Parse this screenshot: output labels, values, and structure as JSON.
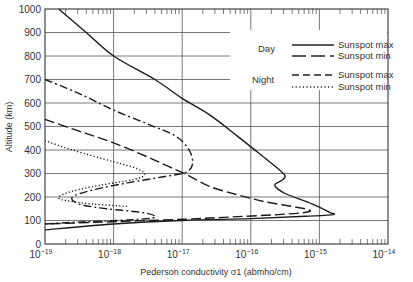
{
  "chart_data": {
    "type": "line",
    "title": "",
    "xlabel": "Pederson conductivity σ1 (abmho/cm)",
    "ylabel": "Altitude (km)",
    "xscale": "log",
    "xlim": [
      1e-19,
      1e-14
    ],
    "ylim": [
      0,
      1000
    ],
    "grid": true,
    "x_tick_labels": [
      "10^-19",
      "10^-18",
      "10^-17",
      "10^-16",
      "10^-15",
      "10^-14"
    ],
    "y_tick_labels": [
      "0",
      "100",
      "200",
      "300",
      "400",
      "500",
      "600",
      "700",
      "800",
      "900",
      "1000"
    ],
    "legend": {
      "position": "upper right",
      "groups": [
        {
          "label": "Day",
          "entries": [
            {
              "name": "Sunspot max",
              "style": "solid"
            },
            {
              "name": "Sunspot min",
              "style": "long-dash"
            }
          ]
        },
        {
          "label": "Night",
          "entries": [
            {
              "name": "Sunspot max",
              "style": "short-dash"
            },
            {
              "name": "Sunspot min",
              "style": "dotted"
            }
          ]
        }
      ]
    },
    "series": [
      {
        "name": "Day Sunspot max",
        "style": "solid",
        "log10_sigma": [
          -19.0,
          -18.0,
          -17.0,
          -16.2,
          -15.9,
          -15.8,
          -15.1,
          -14.8,
          -15.8,
          -17.0,
          -18.8
        ],
        "altitude_km": [
          55,
          75,
          90,
          100,
          110,
          120,
          180,
          130,
          110,
          95,
          1000
        ]
      }
    ],
    "curves": [
      {
        "name": "Day Sunspot max",
        "style": "solid",
        "points": [
          [
            -18.8,
            1000
          ],
          [
            -18.4,
            900
          ],
          [
            -18.0,
            800
          ],
          [
            -17.4,
            700
          ],
          [
            -17.0,
            620
          ],
          [
            -16.6,
            550
          ],
          [
            -16.2,
            460
          ],
          [
            -15.9,
            390
          ],
          [
            -15.6,
            320
          ],
          [
            -15.5,
            290
          ],
          [
            -15.55,
            270
          ],
          [
            -15.65,
            250
          ],
          [
            -15.5,
            215
          ],
          [
            -15.1,
            170
          ],
          [
            -14.85,
            135
          ],
          [
            -14.8,
            125
          ],
          [
            -15.2,
            118
          ],
          [
            -16.0,
            108
          ],
          [
            -17.0,
            100
          ],
          [
            -18.0,
            85
          ],
          [
            -19.0,
            60
          ]
        ]
      },
      {
        "name": "Day Sunspot min",
        "style": "long-dash",
        "points": [
          [
            -19.0,
            530
          ],
          [
            -18.5,
            480
          ],
          [
            -18.0,
            430
          ],
          [
            -17.5,
            370
          ],
          [
            -17.2,
            330
          ],
          [
            -16.9,
            290
          ],
          [
            -16.6,
            245
          ],
          [
            -16.2,
            210
          ],
          [
            -15.8,
            180
          ],
          [
            -15.4,
            160
          ],
          [
            -15.15,
            145
          ],
          [
            -15.2,
            135
          ],
          [
            -15.6,
            125
          ],
          [
            -16.3,
            115
          ],
          [
            -17.0,
            105
          ],
          [
            -18.0,
            95
          ],
          [
            -19.0,
            85
          ]
        ]
      },
      {
        "name": "Night Sunspot max",
        "style": "short-dash / dash-dot",
        "points": [
          [
            -19.0,
            700
          ],
          [
            -18.5,
            640
          ],
          [
            -18.0,
            570
          ],
          [
            -17.5,
            510
          ],
          [
            -17.1,
            460
          ],
          [
            -16.9,
            400
          ],
          [
            -16.85,
            340
          ],
          [
            -16.95,
            305
          ],
          [
            -17.3,
            285
          ],
          [
            -17.8,
            260
          ],
          [
            -18.3,
            230
          ],
          [
            -18.6,
            200
          ],
          [
            -18.5,
            170
          ],
          [
            -18.1,
            150
          ],
          [
            -17.6,
            135
          ],
          [
            -17.4,
            120
          ],
          [
            -17.45,
            110
          ],
          [
            -17.8,
            102
          ],
          [
            -18.4,
            95
          ],
          [
            -19.0,
            85
          ]
        ]
      },
      {
        "name": "Night Sunspot min",
        "style": "dotted",
        "points": [
          [
            -19.0,
            440
          ],
          [
            -18.6,
            400
          ],
          [
            -18.0,
            350
          ],
          [
            -17.65,
            320
          ],
          [
            -17.55,
            295
          ],
          [
            -17.7,
            275
          ],
          [
            -18.2,
            250
          ],
          [
            -18.6,
            225
          ],
          [
            -18.8,
            200
          ],
          [
            -18.7,
            185
          ],
          [
            -18.3,
            170
          ],
          [
            -17.8,
            160
          ]
        ]
      }
    ]
  }
}
